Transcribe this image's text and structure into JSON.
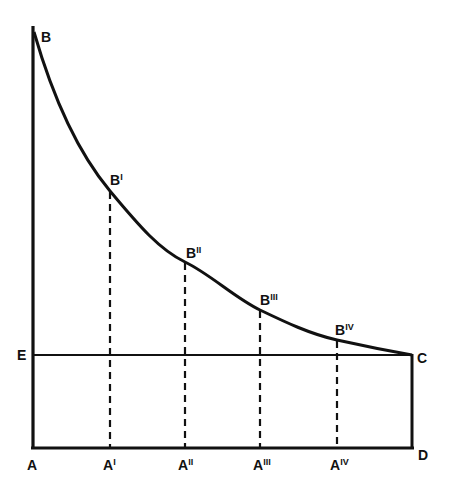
{
  "diagram": {
    "type": "geometric-curve-diagram",
    "stroke_color": "#111111",
    "background": "#ffffff",
    "curve": {
      "name": "BC",
      "description": "Decreasing curve from B down to C",
      "points": [
        [
          33,
          28
        ],
        [
          110,
          191
        ],
        [
          185,
          262
        ],
        [
          260,
          310
        ],
        [
          337,
          340
        ],
        [
          412,
          355
        ]
      ]
    },
    "lines": [
      {
        "name": "AB",
        "from": "A",
        "to": "B",
        "style": "solid"
      },
      {
        "name": "AD",
        "from": "A",
        "to": "D",
        "style": "solid"
      },
      {
        "name": "EC",
        "from": "E",
        "to": "C",
        "style": "solid"
      },
      {
        "name": "CD",
        "from": "C",
        "to": "D",
        "style": "solid"
      },
      {
        "name": "A'B'",
        "from": "A'",
        "to": "B'",
        "style": "dashed"
      },
      {
        "name": "A''B''",
        "from": "A''",
        "to": "B''",
        "style": "dashed"
      },
      {
        "name": "A'''B'''",
        "from": "A'''",
        "to": "B'''",
        "style": "dashed"
      },
      {
        "name": "AivBiv",
        "from": "Aiv",
        "to": "Biv",
        "style": "dashed"
      }
    ],
    "labels": {
      "B": {
        "base": "B",
        "sup": ""
      },
      "B1": {
        "base": "B",
        "sup": "I"
      },
      "B2": {
        "base": "B",
        "sup": "II"
      },
      "B3": {
        "base": "B",
        "sup": "III"
      },
      "B4": {
        "base": "B",
        "sup": "IV"
      },
      "E": {
        "base": "E",
        "sup": ""
      },
      "C": {
        "base": "C",
        "sup": ""
      },
      "A": {
        "base": "A",
        "sup": ""
      },
      "A1": {
        "base": "A",
        "sup": "I"
      },
      "A2": {
        "base": "A",
        "sup": "II"
      },
      "A3": {
        "base": "A",
        "sup": "III"
      },
      "A4": {
        "base": "A",
        "sup": "IV"
      },
      "D": {
        "base": "D",
        "sup": ""
      }
    }
  }
}
